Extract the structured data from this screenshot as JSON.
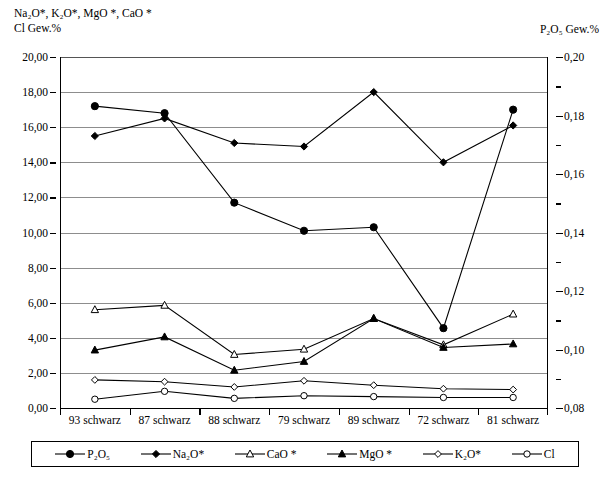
{
  "axes": {
    "left_title_line1": "Na₂O*, K₂O*, MgO *, CaO *",
    "left_title_line2": "Cl Gew.%",
    "right_title": "P₂O₅ Gew.%",
    "left_ticks": [
      "20,00",
      "18,00",
      "16,00",
      "14,00",
      "12,00",
      "10,00",
      "8,00",
      "6,00",
      "4,00",
      "2,00",
      "0,00"
    ],
    "right_ticks": [
      "0,20",
      "0,18",
      "0,16",
      "0,14",
      "0,12",
      "0,10",
      "0,08"
    ]
  },
  "chart_data": {
    "type": "line",
    "xlabel": "",
    "ylabel": "Na₂O*, K₂O*, MgO *, CaO * Cl Gew.%",
    "ylabel_right": "P₂O₅ Gew.%",
    "ylim": [
      0,
      20
    ],
    "ylim_right": [
      0.08,
      0.2
    ],
    "ytick_step": 2,
    "ytick_step_right": 0.02,
    "grid": true,
    "legend_position": "bottom",
    "categories": [
      "93 schwarz",
      "87 schwarz",
      "88 schwarz",
      "79 schwarz",
      "89 schwarz",
      "72 schwarz",
      "81 schwarz"
    ],
    "series": [
      {
        "name": "P₂O₅",
        "axis": "right",
        "marker": "filled-circle",
        "values_right": [
          0.172,
          0.1688,
          0.1417,
          0.1301,
          0.1318,
          0.0955,
          0.1802
        ],
        "values_left_scale": [
          17.2,
          16.8,
          11.7,
          10.1,
          10.3,
          4.55,
          17.0
        ]
      },
      {
        "name": "Na₂O*",
        "axis": "left",
        "marker": "filled-diamond",
        "values": [
          15.5,
          16.5,
          15.1,
          14.9,
          18.0,
          14.0,
          16.1
        ]
      },
      {
        "name": "CaO *",
        "axis": "left",
        "marker": "open-triangle",
        "values": [
          5.6,
          5.85,
          3.05,
          3.35,
          5.1,
          3.6,
          5.35
        ]
      },
      {
        "name": "MgO *",
        "axis": "left",
        "marker": "filled-triangle",
        "values": [
          3.3,
          4.05,
          2.15,
          2.65,
          5.1,
          3.45,
          3.65
        ]
      },
      {
        "name": "K₂O*",
        "axis": "left",
        "marker": "open-diamond",
        "values": [
          1.6,
          1.5,
          1.2,
          1.55,
          1.3,
          1.1,
          1.05
        ]
      },
      {
        "name": "Cl",
        "axis": "left",
        "marker": "open-circle",
        "values": [
          0.5,
          0.95,
          0.55,
          0.7,
          0.65,
          0.6,
          0.6
        ]
      }
    ]
  },
  "legend": {
    "items": [
      {
        "label": "P₂O₅",
        "marker": "filled-circle"
      },
      {
        "label": "Na₂O*",
        "marker": "filled-diamond"
      },
      {
        "label": "CaO *",
        "marker": "open-triangle"
      },
      {
        "label": "MgO *",
        "marker": "filled-triangle"
      },
      {
        "label": "K₂O*",
        "marker": "open-diamond"
      },
      {
        "label": "Cl",
        "marker": "open-circle"
      }
    ]
  },
  "colors": {
    "line": "#000000",
    "grid": "#8d8d8d",
    "axis": "#000000",
    "background": "#ffffff"
  }
}
